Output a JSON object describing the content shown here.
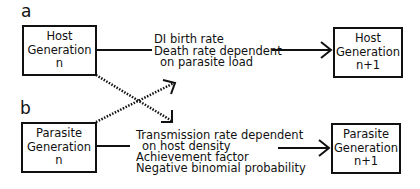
{
  "panels": {
    "a": {
      "label": "a",
      "source_box": {
        "line1": "Host",
        "line2": "Generation",
        "line3": "n"
      },
      "description": [
        "DI birth rate",
        "Death rate dependent",
        "on parasite load"
      ],
      "target_box": {
        "line1": "Host",
        "line2": "Generation",
        "line3": "n+1"
      }
    },
    "b": {
      "label": "b",
      "source_box": {
        "line1": "Parasite",
        "line2": "Generation",
        "line3": "n"
      },
      "description": [
        "Transmission rate dependent",
        "on host density",
        "Achievement factor",
        "Negative binomial probability"
      ],
      "target_box": {
        "line1": "Parasite",
        "line2": "Generation",
        "line3": "n+1"
      }
    }
  },
  "connections": [
    {
      "from": "Host Generation n",
      "to": "Host Generation n+1",
      "style": "solid"
    },
    {
      "from": "Parasite Generation n",
      "to": "Parasite Generation n+1",
      "style": "solid"
    },
    {
      "from": "Host Generation n",
      "to": "Parasite transition",
      "style": "dotted"
    },
    {
      "from": "Parasite Generation n",
      "to": "Host transition",
      "style": "dotted"
    }
  ]
}
